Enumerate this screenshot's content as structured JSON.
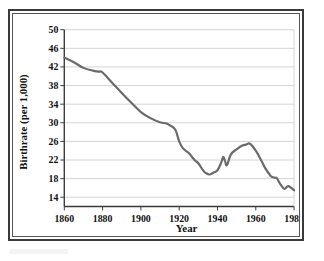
{
  "figure": {
    "frame_color": "#3a3a3a",
    "background": "#ffffff"
  },
  "chart_data": {
    "type": "line",
    "title": "",
    "xlabel": "Year",
    "ylabel": "Birthrate (per 1,000)",
    "xlim": [
      1860,
      1980
    ],
    "ylim": [
      12,
      50
    ],
    "xticks": [
      1860,
      1880,
      1900,
      1920,
      1940,
      1960,
      1980
    ],
    "yticks": [
      14,
      18,
      22,
      26,
      30,
      34,
      38,
      42,
      46,
      50
    ],
    "grid": "horizontal",
    "legend": "none",
    "line_color": "#6a6a6a",
    "line_width": 2.2,
    "series": [
      {
        "name": "Birthrate",
        "x": [
          1860,
          1865,
          1870,
          1875,
          1878,
          1880,
          1885,
          1890,
          1895,
          1900,
          1905,
          1910,
          1913,
          1915,
          1918,
          1920,
          1922,
          1925,
          1928,
          1930,
          1933,
          1935,
          1936,
          1938,
          1940,
          1942,
          1943,
          1944,
          1945,
          1947,
          1950,
          1953,
          1955,
          1957,
          1960,
          1963,
          1965,
          1967,
          1968,
          1970,
          1971,
          1973,
          1975,
          1977,
          1980
        ],
        "values": [
          44.0,
          43.0,
          41.8,
          41.2,
          41.0,
          40.8,
          38.6,
          36.4,
          34.3,
          32.3,
          31.0,
          30.1,
          29.9,
          29.5,
          28.5,
          26.0,
          24.5,
          23.5,
          22.0,
          21.3,
          19.5,
          19.0,
          18.9,
          19.3,
          19.8,
          21.5,
          22.7,
          21.7,
          20.9,
          23.2,
          24.3,
          25.1,
          25.3,
          25.5,
          24.0,
          21.8,
          20.2,
          19.0,
          18.5,
          18.2,
          18.1,
          16.7,
          15.8,
          16.4,
          15.5
        ]
      }
    ]
  },
  "axes": {
    "y_tick_labels": [
      "50",
      "46",
      "42",
      "38",
      "34",
      "30",
      "26",
      "22",
      "18",
      "14"
    ],
    "x_tick_labels": [
      "1860",
      "1880",
      "1900",
      "1920",
      "1940",
      "1960",
      "1980"
    ],
    "x_axis_title": "Year",
    "y_axis_title": "Birthrate (per 1,000)"
  }
}
